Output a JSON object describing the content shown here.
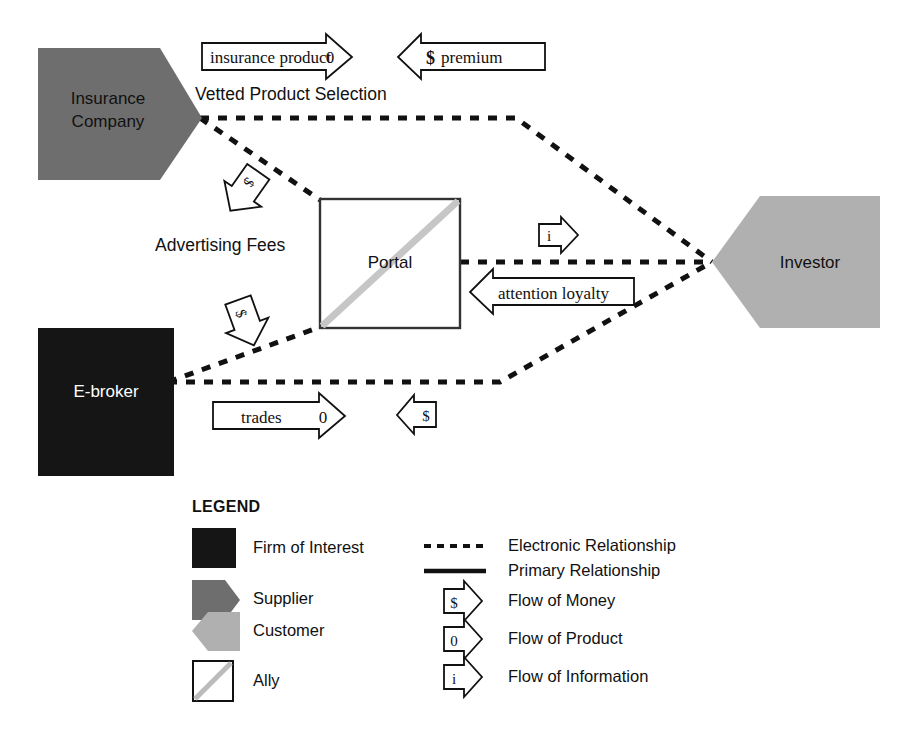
{
  "diagram": {
    "nodes": [
      {
        "id": "insurance-company",
        "label": "Insurance\nCompany",
        "role": "Supplier",
        "shape": "pentagon-right",
        "fill": "#6e6e6e",
        "text_color": "#111111"
      },
      {
        "id": "e-broker",
        "label": "E-broker",
        "role": "Firm of Interest",
        "shape": "square",
        "fill": "#151515",
        "text_color": "#ffffff"
      },
      {
        "id": "portal",
        "label": "Portal",
        "role": "Ally",
        "shape": "square-diagonal",
        "fill": "#ffffff",
        "text_color": "#111111"
      },
      {
        "id": "investor",
        "label": "Investor",
        "role": "Customer",
        "shape": "pentagon-left",
        "fill": "#b0b0b0",
        "text_color": "#111111"
      }
    ],
    "edge_labels": [
      {
        "id": "vetted-product-selection",
        "text": "Vetted Product Selection"
      },
      {
        "id": "advertising-fees",
        "text": "Advertising Fees"
      }
    ],
    "flow_arrows": [
      {
        "id": "insurance-product",
        "text": "insurance product",
        "glyph": "0",
        "type": "product",
        "direction": "right"
      },
      {
        "id": "premium",
        "text": "premium",
        "glyph": "$",
        "type": "money",
        "direction": "left"
      },
      {
        "id": "advertising-fee-money-top",
        "text": "",
        "glyph": "$",
        "type": "money",
        "direction": "down-right"
      },
      {
        "id": "advertising-fee-money-bottom",
        "text": "",
        "glyph": "$",
        "type": "money",
        "direction": "up-right"
      },
      {
        "id": "information-to-investor",
        "text": "",
        "glyph": "i",
        "type": "information",
        "direction": "right"
      },
      {
        "id": "attention-loyalty",
        "text": "attention loyalty",
        "glyph": "",
        "type": "information",
        "direction": "left"
      },
      {
        "id": "trades",
        "text": "trades",
        "glyph": "0",
        "type": "product",
        "direction": "right"
      },
      {
        "id": "trades-money",
        "text": "",
        "glyph": "$",
        "type": "money",
        "direction": "left"
      }
    ]
  },
  "legend": {
    "title": "LEGEND",
    "shape_items": [
      {
        "id": "firm-of-interest",
        "label": "Firm of Interest",
        "swatch": "square",
        "fill": "#151515"
      },
      {
        "id": "supplier",
        "label": "Supplier",
        "swatch": "pentagon-right",
        "fill": "#6e6e6e"
      },
      {
        "id": "customer",
        "label": "Customer",
        "swatch": "pentagon-left",
        "fill": "#b0b0b0"
      },
      {
        "id": "ally",
        "label": "Ally",
        "swatch": "square-diagonal",
        "fill": "#ffffff"
      }
    ],
    "relation_items": [
      {
        "id": "electronic-relationship",
        "label": "Electronic Relationship",
        "swatch": "dashed-line"
      },
      {
        "id": "primary-relationship",
        "label": "Primary Relationship",
        "swatch": "solid-line"
      },
      {
        "id": "flow-of-money",
        "label": "Flow of Money",
        "swatch": "arrow",
        "glyph": "$"
      },
      {
        "id": "flow-of-product",
        "label": "Flow of Product",
        "swatch": "arrow",
        "glyph": "0"
      },
      {
        "id": "flow-of-information",
        "label": "Flow of Information",
        "swatch": "arrow",
        "glyph": "i"
      }
    ]
  },
  "colors": {
    "firm_of_interest": "#151515",
    "supplier": "#6e6e6e",
    "customer": "#b0b0b0",
    "ally_diagonal": "#c6c6c6",
    "line": "#111111",
    "background": "#ffffff"
  }
}
